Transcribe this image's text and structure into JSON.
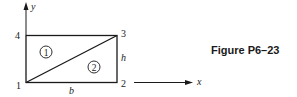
{
  "figure": {
    "caption": "Figure P6–23",
    "axes": {
      "x_label": "x",
      "y_label": "y"
    },
    "nodes": [
      {
        "id": "1",
        "label": "1",
        "position": "bottom-left"
      },
      {
        "id": "2",
        "label": "2",
        "position": "bottom-right"
      },
      {
        "id": "3",
        "label": "3",
        "position": "top-right"
      },
      {
        "id": "4",
        "label": "4",
        "position": "top-left"
      }
    ],
    "elements": [
      {
        "id": "1",
        "label": "1",
        "nodes": [
          "1",
          "3",
          "4"
        ]
      },
      {
        "id": "2",
        "label": "2",
        "nodes": [
          "1",
          "2",
          "3"
        ]
      }
    ],
    "dimensions": {
      "width_label": "b",
      "height_label": "h"
    },
    "colors": {
      "ink": "#1a1a1a",
      "background": "#ffffff"
    }
  }
}
